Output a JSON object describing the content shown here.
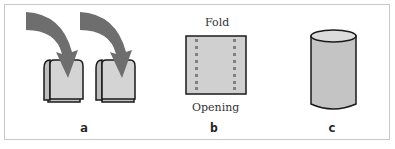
{
  "figure": {
    "panels": [
      {
        "id": "a",
        "label": "a",
        "description": "two folded pouches with curved arrows pointing into them"
      },
      {
        "id": "b",
        "label": "b",
        "top_text": "Fold",
        "bottom_text": "Opening",
        "description": "flat rectangle with two columns of dotted seal lines"
      },
      {
        "id": "c",
        "label": "c",
        "description": "cylinder"
      }
    ],
    "colors": {
      "arrow": "#6e6e6e",
      "fill": "#d0d0d0",
      "outline": "#1a1a1a",
      "dots": "#808080",
      "border": "#c8c8c8"
    }
  }
}
